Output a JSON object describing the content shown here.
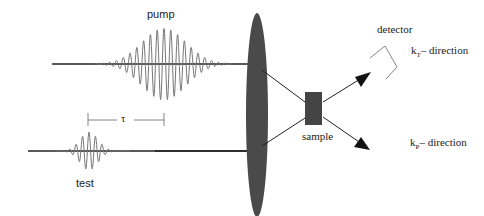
{
  "labels": {
    "pump": "pump",
    "test": "test",
    "tau": "τ",
    "sample": "sample",
    "detector": "detector",
    "kt_k": "k",
    "kt_sub": "T",
    "kt_rest": "– direction",
    "kp_k": "k",
    "kp_sub": "P",
    "kp_rest": "– direction"
  },
  "colors": {
    "line": "#222222",
    "pulse": "#666666",
    "lens": "#4a4a4a",
    "sample": "#444444"
  }
}
